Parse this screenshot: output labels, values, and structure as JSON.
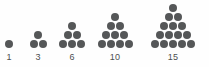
{
  "figure": {
    "width": 209,
    "height": 67,
    "background_color": "#fefefe",
    "dot_color": "#555758",
    "label_color": "#4d4f50",
    "dot_diameter": 8,
    "dot_spacing_x": 9,
    "dot_spacing_y": 9,
    "baseline_y": 44,
    "label_y": 53
  },
  "chart_data": {
    "type": "scatter",
    "xlabel": "",
    "ylabel": "",
    "categories": [
      "1",
      "3",
      "6",
      "10",
      "15"
    ],
    "values": [
      1,
      3,
      6,
      10,
      15
    ],
    "series": [
      {
        "name": "dot count",
        "values": [
          1,
          3,
          6,
          10,
          15
        ]
      },
      {
        "name": "rows",
        "values": [
          1,
          2,
          3,
          4,
          5
        ]
      }
    ],
    "annotations": [
      "1",
      "3",
      "6",
      "10",
      "15"
    ]
  },
  "groups": [
    {
      "name": "triangle-1",
      "label": "1",
      "rows": 1,
      "count": 1,
      "center_x": 9
    },
    {
      "name": "triangle-3",
      "label": "3",
      "rows": 2,
      "count": 3,
      "center_x": 38
    },
    {
      "name": "triangle-6",
      "label": "6",
      "rows": 3,
      "count": 6,
      "center_x": 72
    },
    {
      "name": "triangle-10",
      "label": "10",
      "rows": 4,
      "count": 10,
      "center_x": 115
    },
    {
      "name": "triangle-15",
      "label": "15",
      "rows": 5,
      "count": 15,
      "center_x": 173
    }
  ]
}
